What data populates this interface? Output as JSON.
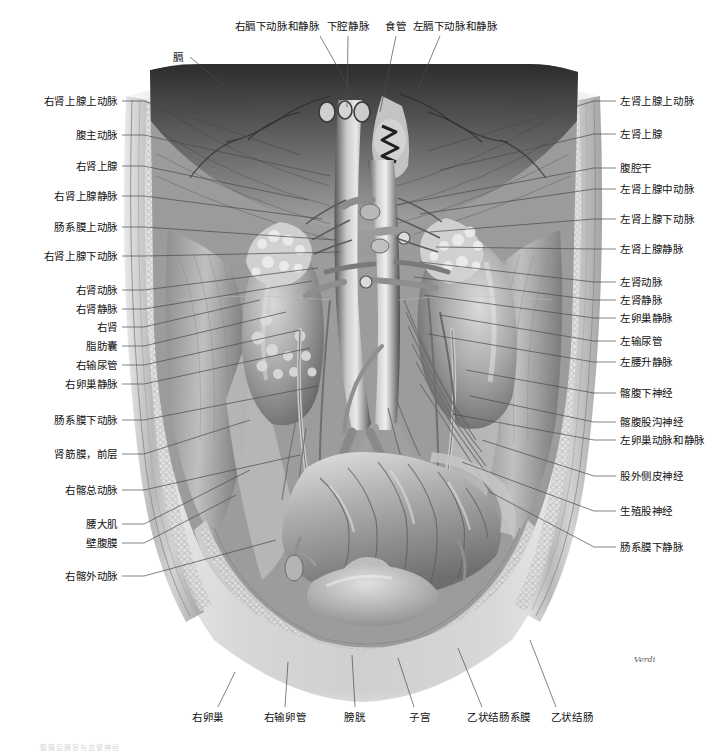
{
  "figure": {
    "signature": "Verdi",
    "caption": "腹膜后器官与血管神经",
    "style": "grayscale-medical-illustration"
  },
  "labels_top": [
    {
      "text": "右膈下动脉和静脉",
      "x": 277,
      "y": 26,
      "lx": 320,
      "ly": 36,
      "tx": 354,
      "ty": 96
    },
    {
      "text": "下腔静脉",
      "x": 348,
      "y": 26,
      "lx": 348,
      "ly": 36,
      "tx": 347,
      "ty": 107
    },
    {
      "text": "食管",
      "x": 396,
      "y": 26,
      "lx": 396,
      "ly": 36,
      "tx": 380,
      "ty": 112
    },
    {
      "text": "左膈下动脉和静脉",
      "x": 455,
      "y": 26,
      "lx": 440,
      "ly": 36,
      "tx": 414,
      "ty": 97
    }
  ],
  "labels_left_top": [
    {
      "text": "膈",
      "x": 178,
      "y": 57,
      "lx": 190,
      "ly": 57,
      "tx": 232,
      "ty": 92
    }
  ],
  "labels_left": [
    {
      "text": "右肾上腺上动脉",
      "y": 101,
      "tx": 300,
      "ty": 155
    },
    {
      "text": "腹主动脉",
      "y": 135,
      "tx": 330,
      "ty": 176
    },
    {
      "text": "右肾上腺",
      "y": 166,
      "tx": 308,
      "ty": 200
    },
    {
      "text": "右肾上腺静脉",
      "y": 196,
      "tx": 322,
      "ty": 219
    },
    {
      "text": "肠系膜上动脉",
      "y": 227,
      "tx": 336,
      "ty": 240
    },
    {
      "text": "右肾上腺下动脉",
      "y": 256,
      "tx": 340,
      "ty": 252
    },
    {
      "text": "右肾动脉",
      "y": 290,
      "tx": 318,
      "ty": 268
    },
    {
      "text": "右肾静脉",
      "y": 309,
      "tx": 312,
      "ty": 281
    },
    {
      "text": "右肾",
      "y": 327,
      "tx": 260,
      "ty": 300
    },
    {
      "text": "脂肪囊",
      "y": 346,
      "tx": 286,
      "ty": 312
    },
    {
      "text": "右输尿管",
      "y": 365,
      "tx": 300,
      "ty": 330
    },
    {
      "text": "右卵巢静脉",
      "y": 384,
      "tx": 310,
      "ty": 348
    },
    {
      "text": "肠系膜下动脉",
      "y": 420,
      "tx": 318,
      "ty": 386
    },
    {
      "text": "肾筋膜，前层",
      "y": 454,
      "tx": 250,
      "ty": 420
    },
    {
      "text": "右髂总动脉",
      "y": 490,
      "tx": 300,
      "ty": 455
    },
    {
      "text": "腰大肌",
      "y": 524,
      "tx": 250,
      "ty": 470
    },
    {
      "text": "壁腹膜",
      "y": 543,
      "tx": 236,
      "ty": 495
    },
    {
      "text": "右髂外动脉",
      "y": 576,
      "tx": 276,
      "ty": 540
    }
  ],
  "labels_right": [
    {
      "text": "左肾上腺上动脉",
      "y": 101,
      "tx": 428,
      "ty": 151
    },
    {
      "text": "左肾上腺",
      "y": 134,
      "tx": 440,
      "ty": 170
    },
    {
      "text": "腹腔干",
      "y": 168,
      "tx": 396,
      "ty": 205
    },
    {
      "text": "左肾上腺中动脉",
      "y": 189,
      "tx": 420,
      "ty": 214
    },
    {
      "text": "左肾上腺下动脉",
      "y": 219,
      "tx": 430,
      "ty": 232
    },
    {
      "text": "左肾上腺静脉",
      "y": 249,
      "tx": 436,
      "ty": 247
    },
    {
      "text": "左肾动脉",
      "y": 282,
      "tx": 420,
      "ty": 262
    },
    {
      "text": "左肾静脉",
      "y": 300,
      "tx": 414,
      "ty": 277
    },
    {
      "text": "左卵巢静脉",
      "y": 318,
      "tx": 424,
      "ty": 295
    },
    {
      "text": "左输尿管",
      "y": 341,
      "tx": 440,
      "ty": 315
    },
    {
      "text": "左腰升静脉",
      "y": 362,
      "tx": 428,
      "ty": 334
    },
    {
      "text": "髂腹下神经",
      "y": 393,
      "tx": 466,
      "ty": 370
    },
    {
      "text": "髂腹股沟神经",
      "y": 422,
      "tx": 470,
      "ty": 396
    },
    {
      "text": "左卵巢动脉和静脉",
      "y": 440,
      "tx": 452,
      "ty": 414
    },
    {
      "text": "股外侧皮神经",
      "y": 476,
      "tx": 482,
      "ty": 440
    },
    {
      "text": "生殖股神经",
      "y": 511,
      "tx": 462,
      "ty": 462
    },
    {
      "text": "肠系膜下静脉",
      "y": 547,
      "tx": 490,
      "ty": 492
    }
  ],
  "labels_bottom": [
    {
      "text": "右卵巢",
      "x": 208,
      "y": 717,
      "lx": 218,
      "ly": 707,
      "tx": 235,
      "ty": 672
    },
    {
      "text": "右输卵管",
      "x": 285,
      "y": 717,
      "lx": 285,
      "ly": 707,
      "tx": 288,
      "ty": 662
    },
    {
      "text": "膀胱",
      "x": 355,
      "y": 717,
      "lx": 355,
      "ly": 707,
      "tx": 352,
      "ty": 655
    },
    {
      "text": "子宫",
      "x": 420,
      "y": 717,
      "lx": 414,
      "ly": 707,
      "tx": 398,
      "ty": 658
    },
    {
      "text": "乙状结肠系膜",
      "x": 499,
      "y": 717,
      "lx": 482,
      "ly": 707,
      "tx": 458,
      "ty": 648
    },
    {
      "text": "乙状结肠",
      "x": 572,
      "y": 717,
      "lx": 556,
      "ly": 707,
      "tx": 530,
      "ty": 640
    }
  ],
  "colors": {
    "leader": "#4a4a4a",
    "text": "#111111",
    "background": "#ffffff",
    "art_mid": "#9b9b9b",
    "art_dark": "#3a3a3a",
    "art_light": "#d9d9d9"
  }
}
